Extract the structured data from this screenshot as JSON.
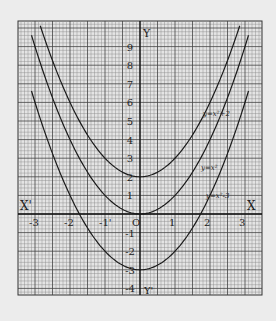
{
  "chart_data": {
    "type": "line",
    "title": "",
    "xlabel": "X",
    "xlabel_neg": "X'",
    "ylabel": "Y",
    "ylabel_neg": "Y'",
    "xlim": [
      -3.4,
      3.4
    ],
    "ylim": [
      -4.4,
      10.3
    ],
    "grid": true,
    "x_ticks": [
      -3,
      -2,
      -1,
      0,
      1,
      2,
      3
    ],
    "x_tick_labels": [
      "-3",
      "-2",
      "-1'",
      "O",
      "1",
      "2",
      "3"
    ],
    "y_ticks": [
      9,
      8,
      7,
      6,
      5,
      4,
      3,
      2,
      1,
      -1,
      -2,
      -3,
      -4
    ],
    "y_tick_labels": [
      "9",
      "8",
      "7",
      "6",
      "5",
      "4",
      "3",
      "2",
      "1",
      "-1",
      "-2",
      "-3",
      "-4"
    ],
    "series": [
      {
        "name": "y=x²+2",
        "label": "y=x²+2",
        "expr_a": 1,
        "expr_c": 2,
        "x": [
          -2.85,
          -2,
          -1,
          0,
          1,
          2,
          2.85
        ],
        "y": [
          10.1,
          6,
          3,
          2,
          3,
          6,
          10.1
        ]
      },
      {
        "name": "y=x²",
        "label": "y=x²",
        "expr_a": 1,
        "expr_c": 0,
        "x": [
          -3.1,
          -2,
          -1,
          0,
          1,
          2,
          3.1
        ],
        "y": [
          9.6,
          4,
          1,
          0,
          1,
          4,
          9.6
        ]
      },
      {
        "name": "y=x²-3",
        "label": "y=x²-3",
        "expr_a": 1,
        "expr_c": -3,
        "x": [
          -3.1,
          -2,
          -1,
          0,
          1,
          2,
          3.1
        ],
        "y": [
          6.6,
          1,
          -2,
          -3,
          -2,
          1,
          6.6
        ]
      }
    ]
  },
  "colors": {
    "background": "#ececec",
    "paper": "#e4e4e4",
    "grid_minor": "#7a7a7a",
    "grid_major": "#333333",
    "curve": "#1a1a1a",
    "text": "#222222"
  }
}
